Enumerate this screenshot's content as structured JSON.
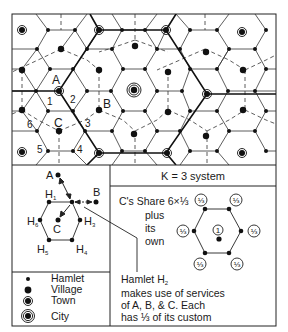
{
  "diagram": {
    "title": "K = 3 system",
    "map": {
      "labels": {
        "A": "A",
        "B": "B",
        "C": "C",
        "n1": "1",
        "n2": "2",
        "n3": "3",
        "n4": "4",
        "n5": "5",
        "n6": "6"
      }
    },
    "detail": {
      "A": "A",
      "B": "B",
      "C": "C",
      "H1": "H",
      "H1_sub": "1",
      "H3": "H",
      "H3_sub": "3",
      "H4": "H",
      "H4_sub": "4",
      "H5": "H",
      "H5_sub": "5",
      "H6": "H",
      "H6_sub": "6"
    },
    "share": {
      "line1": "C's Share  6×⅓",
      "line2": "plus",
      "line3": "its",
      "line4": "own",
      "center_value": "1",
      "vertex_value": "⅓"
    },
    "hamlet_note": {
      "line1": "Hamlet H",
      "line1_sub": "2",
      "line2": "makes use of services",
      "line3": "of A, B, & C. Each",
      "line4": "has ⅓ of its custom"
    },
    "legend": [
      {
        "label": "Hamlet",
        "symbol": "small-dot"
      },
      {
        "label": "Village",
        "symbol": "large-dot"
      },
      {
        "label": "Town",
        "symbol": "ringed-dot"
      },
      {
        "label": "City",
        "symbol": "double-ringed-dot"
      }
    ]
  }
}
